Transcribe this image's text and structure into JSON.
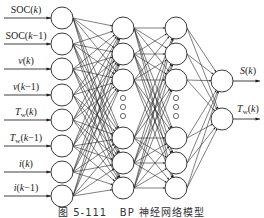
{
  "diagram": {
    "caption": "图 5-111   BP 神经网络模型",
    "line_color": "#2a2a2a",
    "node_radius": 11,
    "layers": [
      {
        "name": "input",
        "x": 62,
        "nodes": [
          {
            "y": 18,
            "label": "SOC(k)",
            "label_y": 10
          },
          {
            "y": 44,
            "label": "SOC(k−1)",
            "label_y": 36
          },
          {
            "y": 69,
            "label": "v(k)",
            "label_y": 61
          },
          {
            "y": 95,
            "label": "v(k−1)",
            "label_y": 87
          },
          {
            "y": 120,
            "label": "Tw(k)",
            "label_y": 112
          },
          {
            "y": 146,
            "label": "Tw(k−1)",
            "label_y": 138
          },
          {
            "y": 172,
            "label": "i(k)",
            "label_y": 164
          },
          {
            "y": 196,
            "label": "i(k−1)",
            "label_y": 188
          }
        ]
      },
      {
        "name": "hidden-1",
        "x": 123,
        "nodes": [
          {
            "y": 28
          },
          {
            "y": 54
          },
          {
            "y": 80
          },
          {
            "y": 138
          },
          {
            "y": 163
          },
          {
            "y": 188
          }
        ],
        "ellipsis_y": [
          98,
          107,
          116
        ]
      },
      {
        "name": "hidden-2",
        "x": 176,
        "nodes": [
          {
            "y": 28
          },
          {
            "y": 54
          },
          {
            "y": 80
          },
          {
            "y": 138
          },
          {
            "y": 163
          },
          {
            "y": 188
          }
        ],
        "ellipsis_y": [
          98,
          107,
          116
        ]
      },
      {
        "name": "output",
        "x": 222,
        "nodes": [
          {
            "y": 81,
            "label": "S(k)",
            "label_y": 71
          },
          {
            "y": 119,
            "label": "Tw(k)",
            "label_y": 109
          }
        ]
      }
    ],
    "input_labels": {
      "soc_k": "SOC(k)",
      "soc_k1": "SOC(k−1)",
      "v_k": "v(k)",
      "v_k1": "v(k−1)",
      "tw_k": "Tw(k)",
      "tw_k1": "Tw(k−1)",
      "i_k": "i(k)",
      "i_k1": "i(k−1)"
    },
    "output_labels": {
      "s_k": "S(k)",
      "tw_k": "Tw(k)"
    }
  }
}
